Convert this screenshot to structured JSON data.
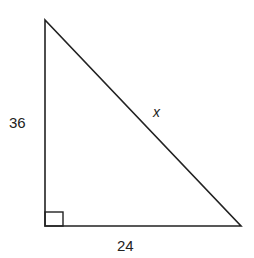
{
  "diagram": {
    "type": "right-triangle",
    "labels": {
      "vertical_leg": "36",
      "horizontal_leg": "24",
      "hypotenuse": "x"
    },
    "right_angle_marker": true,
    "vertices": {
      "top": [
        45,
        20
      ],
      "right_angle": [
        45,
        226
      ],
      "bottom_right": [
        241,
        226
      ]
    },
    "colors": {
      "stroke": "#222222",
      "background": "#ffffff"
    }
  }
}
